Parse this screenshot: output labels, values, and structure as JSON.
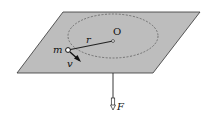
{
  "diagram": {
    "type": "physics-figure",
    "colors": {
      "plane_fill": "#bdbdbd",
      "plane_stroke": "#333333",
      "line": "#222222",
      "orbit_dash": "#555555"
    },
    "labels": {
      "center": "O",
      "radius": "r",
      "mass": "m",
      "velocity": "v",
      "force": "F"
    }
  }
}
